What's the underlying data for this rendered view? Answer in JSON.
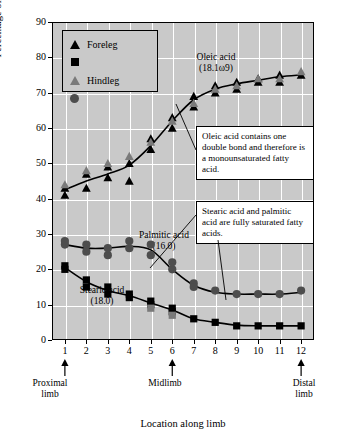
{
  "chart_data": {
    "type": "scatter",
    "title": "",
    "xlabel": "Location along limb",
    "ylabel": "Percentage of all fatty acids (%)",
    "xlim": [
      0.4,
      12.6
    ],
    "ylim": [
      0,
      90
    ],
    "ytick_labels": [
      "0",
      "10",
      "20",
      "30",
      "40",
      "50",
      "60",
      "70",
      "80",
      "90"
    ],
    "ytick_values": [
      0,
      10,
      20,
      30,
      40,
      50,
      60,
      70,
      80,
      90
    ],
    "xtick_labels": [
      "1",
      "2",
      "3",
      "4",
      "5",
      "6",
      "7",
      "8",
      "9",
      "10",
      "11",
      "12"
    ],
    "xtick_values": [
      1,
      2,
      3,
      4,
      5,
      6,
      7,
      8,
      9,
      10,
      11,
      12
    ],
    "grid": true,
    "plot_background": "#c9c9c9",
    "legend_position": "top-left",
    "legend": [
      {
        "label": "Foreleg",
        "marker": "triangle",
        "color": "#000000"
      },
      {
        "label": "Foreleg",
        "marker": "square",
        "color": "#000000"
      },
      {
        "label": "Hindleg",
        "marker": "triangle",
        "color": "#7a7a7a"
      },
      {
        "label": "Hindleg",
        "marker": "circle",
        "color": "#5a5a5a"
      }
    ],
    "region_labels": [
      {
        "text": "Proximal\nlimb",
        "x": 1
      },
      {
        "text": "Midlimb",
        "x": 6
      },
      {
        "text": "Distal\nlimb",
        "x": 12
      }
    ],
    "annotations": [
      {
        "name": "oleic-acid-label",
        "text": "Oleic acid\n(18.1ω9)"
      },
      {
        "name": "palmitic-acid-label",
        "text": "Palmitic acid\n(16.0)"
      },
      {
        "name": "stearic-acid-label",
        "text": "Stearic acid\n(18.0)"
      },
      {
        "name": "oleic-callout",
        "text": "Oleic acid contains one double bond and therefore is a monounsaturated fatty acid."
      },
      {
        "name": "saturated-callout",
        "text": "Stearic acid and palmitic acid are fully saturated fatty acids."
      }
    ],
    "series": [
      {
        "name": "Oleic acid (18.1ω9) — foreleg",
        "marker": "triangle",
        "color": "#000000",
        "x": [
          1,
          1,
          2,
          2,
          3,
          3,
          4,
          4,
          5,
          5,
          6,
          6,
          7,
          7,
          8,
          8,
          9,
          9,
          10,
          10,
          11,
          11,
          12
        ],
        "y": [
          41,
          43,
          43,
          47,
          46,
          49,
          45,
          50,
          54,
          57,
          60,
          63,
          66,
          69,
          70,
          72,
          71,
          73,
          73,
          74,
          73,
          75,
          75
        ]
      },
      {
        "name": "Oleic acid (18.1ω9) — hindleg",
        "marker": "triangle",
        "color": "#7a7a7a",
        "x": [
          1,
          2,
          3,
          4,
          5,
          6,
          7,
          8,
          9,
          10,
          11,
          12
        ],
        "y": [
          44,
          48,
          50,
          52,
          56,
          62,
          67,
          71,
          72,
          74,
          74,
          76
        ]
      },
      {
        "name": "Palmitic acid (16.0) — hindleg",
        "marker": "circle",
        "color": "#4d4d4d",
        "x": [
          1,
          1,
          2,
          2,
          3,
          3,
          4,
          4,
          5,
          5,
          6,
          6,
          7,
          7,
          8,
          9,
          10,
          11,
          12
        ],
        "y": [
          27,
          28,
          25,
          27,
          24,
          26,
          26,
          28,
          27,
          24,
          20,
          22,
          16,
          15,
          14,
          13,
          13,
          13,
          14
        ]
      },
      {
        "name": "Stearic acid (18.0) — foreleg",
        "marker": "square",
        "color": "#000000",
        "x": [
          1,
          1,
          2,
          2,
          3,
          3,
          4,
          4,
          5,
          5,
          6,
          6,
          7,
          8,
          9,
          10,
          11,
          12
        ],
        "y": [
          20,
          21,
          15,
          17,
          13,
          15,
          12,
          13,
          10,
          11,
          8,
          9,
          6,
          5,
          4,
          4,
          4,
          4
        ]
      },
      {
        "name": "Stearic acid (18.0) — hindleg (grey)",
        "marker": "square",
        "color": "#7a7a7a",
        "x": [
          5,
          6
        ],
        "y": [
          9,
          7
        ]
      },
      {
        "name": "fit-line-oleic",
        "type": "fit",
        "x": [
          1,
          2,
          3,
          4,
          5,
          6,
          7,
          8,
          9,
          10,
          11,
          12
        ],
        "y": [
          42.5,
          45,
          47,
          49.5,
          55,
          62,
          68,
          71,
          72.5,
          73.5,
          74.5,
          75
        ]
      },
      {
        "name": "fit-line-palmitic",
        "type": "fit",
        "x": [
          1,
          2,
          3,
          4,
          5,
          6,
          7,
          8,
          9,
          10,
          11,
          12
        ],
        "y": [
          27,
          26,
          26,
          26.5,
          25.5,
          20,
          15.5,
          13.5,
          13,
          13,
          13,
          13.5
        ]
      },
      {
        "name": "fit-line-stearic",
        "type": "fit",
        "x": [
          1,
          2,
          3,
          4,
          5,
          6,
          7,
          8,
          9,
          10,
          11,
          12
        ],
        "y": [
          20.5,
          16.5,
          14,
          12.5,
          10.5,
          8.5,
          6,
          5,
          4.2,
          4,
          4,
          4
        ]
      }
    ]
  },
  "labels": {
    "ylabel": "Percentage of all fatty acids (%)",
    "xlabel": "Location along limb",
    "legend_foreleg": "Foreleg",
    "legend_hindleg": "Hindleg",
    "oleic_name": "Oleic acid",
    "oleic_code": "(18.1ω9)",
    "palmitic_name": "Palmitic acid",
    "palmitic_code": "(16.0)",
    "stearic_name": "Stearic acid",
    "stearic_code": "(18.0)",
    "callout_oleic": "Oleic acid contains one double bond and therefore is a monounsaturated fatty acid.",
    "callout_saturated": "Stearic acid and palmitic acid are fully saturated fatty acids.",
    "region_proximal_1": "Proximal",
    "region_proximal_2": "limb",
    "region_mid": "Midlimb",
    "region_distal_1": "Distal",
    "region_distal_2": "limb"
  }
}
